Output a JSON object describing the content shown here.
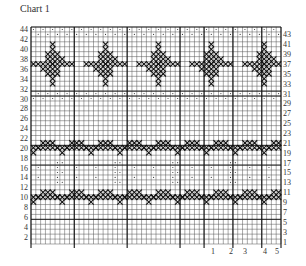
{
  "title": "Chart 1",
  "grid": {
    "rows": 44,
    "cols": 52,
    "left": 31,
    "top": 27,
    "right": 281,
    "bottom": 244,
    "line_color": "#555555",
    "bold_line_color": "#111111",
    "cross_color": "#111111",
    "dot_color": "#333333"
  },
  "left_row_labels": [
    "44",
    "42",
    "40",
    "38",
    "36",
    "34",
    "32",
    "30",
    "28",
    "26",
    "24",
    "22",
    "20",
    "18",
    "16",
    "14",
    "12",
    "10",
    "8",
    "6",
    "4",
    "2"
  ],
  "right_row_labels": [
    "43",
    "41",
    "39",
    "37",
    "35",
    "33",
    "31",
    "29",
    "27",
    "25",
    "23",
    "21",
    "19",
    "17",
    "15",
    "13",
    "11",
    "9",
    "7",
    "5",
    "3",
    "1"
  ],
  "bottom_labels": [
    {
      "text": "1",
      "x": 213
    },
    {
      "text": "2",
      "x": 231
    },
    {
      "text": "3",
      "x": 245
    },
    {
      "text": "4",
      "x": 265
    },
    {
      "text": "5",
      "x": 277
    }
  ],
  "bands": {
    "dot_rows_top": [
      43,
      44
    ],
    "dot_rows_mid": [
      30,
      31
    ],
    "motif_rows": [
      33,
      42
    ],
    "zigzag_upper_rows": [
      19,
      21
    ],
    "seed_rows": [
      13,
      17
    ],
    "zigzag_lower_rows": [
      9,
      11
    ]
  },
  "motif_centers_col": [
    4,
    15,
    26,
    37,
    48
  ]
}
